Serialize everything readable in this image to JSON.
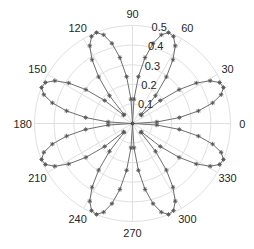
{
  "chart_data": {
    "type": "line",
    "subtype": "polar",
    "title": "",
    "formula": "r = 0.5*|sin(4*theta)|",
    "theta_step_deg": 3.6,
    "theta_range_deg": [
      0,
      360
    ],
    "rlim": [
      0,
      0.5
    ],
    "r_ticks": [
      0.1,
      0.2,
      0.3,
      0.4,
      0.5
    ],
    "r_tick_labels": [
      "0.1",
      "0.2",
      "0.3",
      "0.4",
      "0.5"
    ],
    "theta_ticks": [
      0,
      30,
      60,
      90,
      120,
      150,
      180,
      210,
      240,
      270,
      300,
      330
    ],
    "theta_tick_labels": [
      "0",
      "30",
      "60",
      "90",
      "120",
      "150",
      "180",
      "210",
      "240",
      "270",
      "300",
      "330"
    ],
    "grid": true,
    "series": [
      {
        "name": "rho",
        "marker": "*",
        "line": "-",
        "color": "#6e6e6e",
        "petals": 8,
        "petal_angles_deg": [
          22.5,
          67.5,
          112.5,
          157.5,
          202.5,
          247.5,
          292.5,
          337.5
        ],
        "max_r": 0.5
      }
    ]
  },
  "layout": {
    "center": [
      132.5,
      123.5
    ],
    "radius_px": 98,
    "r_label_angle_deg": 80
  }
}
